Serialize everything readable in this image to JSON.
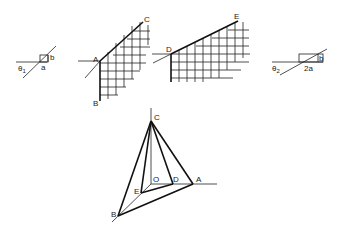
{
  "figures": {
    "fig1": {
      "theta_label": "θ",
      "theta_sub": "1",
      "a_label": "a",
      "b_label": "b"
    },
    "fig2": {
      "label_a": "A",
      "label_b": "B",
      "label_c": "C"
    },
    "fig3": {
      "label_d": "D",
      "label_e": "E"
    },
    "fig4": {
      "theta_label": "θ",
      "theta_sub": "2",
      "a_label": "2a",
      "b_label": "b"
    },
    "pyramid": {
      "label_c": "C",
      "label_o": "O",
      "label_d": "D",
      "label_a": "A",
      "label_e": "E",
      "label_b": "B"
    }
  },
  "colors": {
    "line": "#222222",
    "background": "#ffffff"
  }
}
